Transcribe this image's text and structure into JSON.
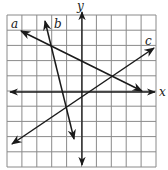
{
  "diagram": {
    "type": "coordinate-plane-with-lines",
    "grid": {
      "x_min": -5,
      "x_max": 5,
      "y_min": -5,
      "y_max": 5,
      "step": 1,
      "cells_x": 10,
      "cells_y": 10
    },
    "axes": {
      "x_label": "x",
      "y_label": "y"
    },
    "colors": {
      "grid": "#8a8a8a",
      "lines": "#1a1a1a",
      "background": "#ffffff"
    },
    "lines": [
      {
        "label": "a",
        "slope": -0.5,
        "from": [
          -4,
          4
        ],
        "to": [
          4,
          0
        ],
        "passes_through": [
          [
            -2,
            3
          ],
          [
            2,
            1
          ]
        ]
      },
      {
        "label": "b",
        "slope": -4,
        "from": [
          -2.5,
          4.7
        ],
        "to": [
          -0.5,
          -3.1
        ],
        "passes_through": [
          [
            -2,
            3
          ],
          [
            -1,
            -1
          ]
        ]
      },
      {
        "label": "c",
        "slope": 0.6667,
        "from": [
          -4.7,
          -3.5
        ],
        "to": [
          4.8,
          2.9
        ],
        "passes_through": [
          [
            -1,
            -1
          ],
          [
            2,
            1
          ]
        ]
      }
    ],
    "intersections": [
      {
        "lines": [
          "a",
          "b"
        ],
        "point": [
          -2,
          3
        ]
      },
      {
        "lines": [
          "a",
          "c"
        ],
        "point": [
          2,
          1
        ]
      },
      {
        "lines": [
          "b",
          "c"
        ],
        "point": [
          -1,
          -1
        ]
      }
    ]
  }
}
